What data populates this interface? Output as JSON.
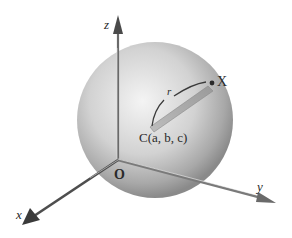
{
  "diagram": {
    "type": "sphere-in-3d-coordinates",
    "labels": {
      "z_axis": "z",
      "x_axis": "x",
      "y_axis": "y",
      "origin": "O",
      "point": "X",
      "radius": "r",
      "center": "C(a, b, c)"
    },
    "colors": {
      "sphere_light": "#f2f2f2",
      "sphere_dark": "#8c8c8c",
      "axis": "#555555",
      "text": "#2a2a2a"
    }
  }
}
